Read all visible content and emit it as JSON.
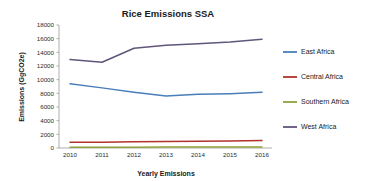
{
  "chart_data": {
    "type": "line",
    "title": "Rice Emissions SSA",
    "xlabel": "Yearly Emissions",
    "ylabel": "Emissions (GgCO2e)",
    "categories": [
      "2010",
      "2011",
      "2012",
      "2013",
      "2014",
      "2015",
      "2016"
    ],
    "x": [
      2010,
      2011,
      2012,
      2013,
      2014,
      2015,
      2016
    ],
    "ylim": [
      0,
      18000
    ],
    "yticks": [
      0,
      2000,
      4000,
      6000,
      8000,
      10000,
      12000,
      14000,
      16000,
      18000
    ],
    "ytick_labels": [
      "0",
      "2000",
      "4000",
      "6000",
      "8000",
      "10000",
      "12000",
      "14000",
      "16000",
      "18000"
    ],
    "grid": false,
    "legend_position": "right",
    "series": [
      {
        "name": "East Africa",
        "color": "#4a7ebb",
        "values": [
          9400,
          8800,
          8150,
          7600,
          7850,
          7950,
          8150
        ]
      },
      {
        "name": "Central Africa",
        "color": "#b3322c",
        "values": [
          830,
          850,
          900,
          950,
          980,
          1020,
          1100
        ]
      },
      {
        "name": "Southern Africa",
        "color": "#8fa13a",
        "values": [
          120,
          120,
          125,
          130,
          130,
          135,
          140
        ]
      },
      {
        "name": "West Africa",
        "color": "#60557a",
        "values": [
          12950,
          12550,
          14600,
          15050,
          15250,
          15500,
          15900
        ]
      }
    ]
  },
  "legend": {
    "items": [
      {
        "label": "East Africa",
        "color": "#4a7ebb"
      },
      {
        "label": "Central Africa",
        "color": "#b3322c"
      },
      {
        "label": "Southern Africa",
        "color": "#8fa13a"
      },
      {
        "label": "West Africa",
        "color": "#60557a"
      }
    ]
  }
}
